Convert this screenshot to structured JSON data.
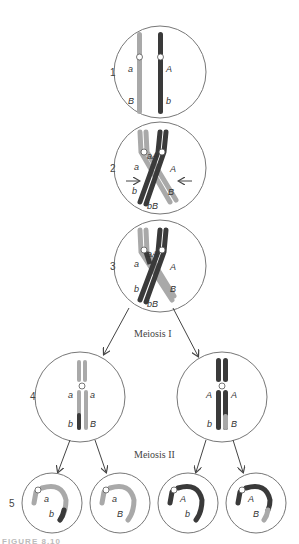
{
  "figure": {
    "colors": {
      "light_chromosome": "#a9a9a9",
      "dark_chromosome": "#3a3a3a",
      "outline": "#777777",
      "arrow": "#444444"
    },
    "steps": [
      {
        "number": "1",
        "labels": {
          "left_upper": "a",
          "left_lower": "B",
          "right_upper": "A",
          "right_lower": "b"
        }
      },
      {
        "number": "2",
        "labels": {
          "top_pair": "aA",
          "left": "a",
          "right": "A",
          "lower_left": "b",
          "lower_right": "B",
          "bottom_pair": "bB"
        }
      },
      {
        "number": "3",
        "labels": {
          "top_pair": "aA",
          "left": "a",
          "right": "A",
          "lower_left": "b",
          "lower_right": "B",
          "bottom_pair": "bB"
        }
      },
      {
        "number": "4",
        "left_cell": {
          "upper_left": "a",
          "upper_right": "a",
          "lower_left": "b",
          "lower_right": "B"
        },
        "right_cell": {
          "upper_left": "A",
          "upper_right": "A",
          "lower_left": "b",
          "lower_right": "B"
        }
      },
      {
        "number": "5",
        "cells": [
          {
            "upper": "a",
            "lower": "b"
          },
          {
            "upper": "a",
            "lower": "B"
          },
          {
            "upper": "A",
            "lower": "b"
          },
          {
            "upper": "A",
            "lower": "B"
          }
        ]
      }
    ],
    "stage_labels": {
      "meiosis_1": "Meiosis I",
      "meiosis_2": "Meiosis II"
    },
    "caption_partial": "FIGURE 8.10"
  }
}
